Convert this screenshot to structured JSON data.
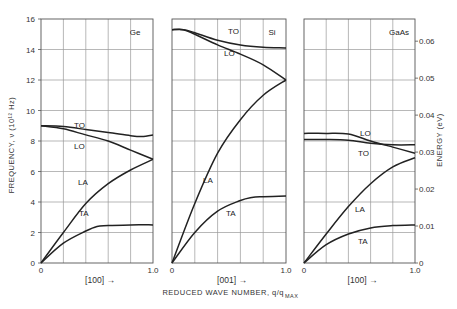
{
  "chart_data": {
    "type": "line",
    "title": "",
    "xlabel": "REDUCED WAVE NUMBER, q/q_MAX",
    "ylabel": "FREQUENCY, ν (10^12 Hz)",
    "ylabel_right": "ENERGY (eV)",
    "ylim": [
      0,
      16
    ],
    "ylim_right": [
      0,
      0.066
    ],
    "y_ticks": [
      0,
      2,
      4,
      6,
      8,
      10,
      12,
      14,
      16
    ],
    "y_ticks_right": [
      0,
      0.01,
      0.02,
      0.03,
      0.04,
      0.05,
      0.06
    ],
    "y_tick_labels_right": [
      "0",
      "0.01",
      "0.02",
      "0.03",
      "0.04",
      "0.05",
      "0.06"
    ],
    "grid": true,
    "panels": [
      {
        "material": "Ge",
        "direction": "[100]",
        "x_ticks": [
          "0",
          "1.0"
        ],
        "xlim": [
          0,
          1
        ],
        "series": [
          {
            "name": "TO",
            "x": [
              0,
              0.2,
              0.4,
              0.6,
              0.8,
              0.9,
              1.0
            ],
            "values": [
              9.0,
              8.95,
              8.75,
              8.55,
              8.35,
              8.3,
              8.4
            ]
          },
          {
            "name": "LO",
            "x": [
              0,
              0.2,
              0.4,
              0.6,
              0.8,
              1.0
            ],
            "values": [
              9.0,
              8.8,
              8.4,
              8.0,
              7.4,
              6.8
            ]
          },
          {
            "name": "LA",
            "x": [
              0,
              0.2,
              0.4,
              0.6,
              0.8,
              1.0
            ],
            "values": [
              0,
              2.0,
              3.9,
              5.2,
              6.1,
              6.8
            ]
          },
          {
            "name": "TA",
            "x": [
              0,
              0.2,
              0.4,
              0.5,
              0.6,
              0.8,
              1.0
            ],
            "values": [
              0,
              1.3,
              2.1,
              2.4,
              2.45,
              2.5,
              2.5
            ]
          }
        ]
      },
      {
        "material": "Si",
        "direction": "[001]",
        "x_ticks": [
          "0",
          "1.0"
        ],
        "xlim": [
          0,
          1
        ],
        "series": [
          {
            "name": "TO",
            "x": [
              0,
              0.1,
              0.2,
              0.4,
              0.6,
              0.8,
              1.0
            ],
            "values": [
              15.3,
              15.3,
              15.1,
              14.6,
              14.3,
              14.15,
              14.1
            ]
          },
          {
            "name": "LO",
            "x": [
              0,
              0.1,
              0.2,
              0.4,
              0.6,
              0.8,
              1.0
            ],
            "values": [
              15.3,
              15.3,
              15.0,
              14.3,
              13.7,
              13.0,
              12.0
            ]
          },
          {
            "name": "LA",
            "x": [
              0,
              0.2,
              0.4,
              0.6,
              0.8,
              1.0
            ],
            "values": [
              0,
              3.9,
              7.2,
              9.4,
              11.0,
              12.0
            ]
          },
          {
            "name": "TA",
            "x": [
              0,
              0.2,
              0.4,
              0.6,
              0.7,
              0.8,
              1.0
            ],
            "values": [
              0,
              2.0,
              3.4,
              4.1,
              4.3,
              4.35,
              4.4
            ]
          }
        ]
      },
      {
        "material": "GaAs",
        "direction": "[100]",
        "x_ticks": [
          "0",
          "1.0"
        ],
        "xlim": [
          0,
          1
        ],
        "series": [
          {
            "name": "LO",
            "x": [
              0,
              0.2,
              0.4,
              0.6,
              0.8,
              1.0
            ],
            "values": [
              8.5,
              8.5,
              8.45,
              8.0,
              7.6,
              7.2
            ]
          },
          {
            "name": "TO",
            "x": [
              0,
              0.2,
              0.4,
              0.6,
              0.8,
              1.0
            ],
            "values": [
              8.1,
              8.1,
              8.05,
              7.85,
              7.75,
              7.75
            ]
          },
          {
            "name": "LA",
            "x": [
              0,
              0.2,
              0.4,
              0.6,
              0.8,
              1.0
            ],
            "values": [
              0,
              1.9,
              3.7,
              5.2,
              6.3,
              6.9
            ]
          },
          {
            "name": "TA",
            "x": [
              0,
              0.2,
              0.4,
              0.6,
              0.8,
              1.0
            ],
            "values": [
              0,
              1.2,
              1.9,
              2.3,
              2.45,
              2.5
            ]
          }
        ]
      }
    ]
  },
  "labels": {
    "y_axis_left": "FREQUENCY, ν (10¹² Hz)",
    "y_axis_right": "ENERGY (eV)",
    "x_axis": "REDUCED WAVE NUMBER, q/q",
    "x_axis_sub": "MAX",
    "arrow": "→"
  }
}
